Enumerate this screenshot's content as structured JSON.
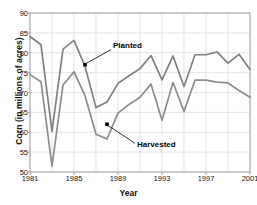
{
  "chart_data": {
    "type": "line",
    "title": "",
    "xlabel": "Year",
    "ylabel": "Corn (in millions of acres)",
    "xlim": [
      1981,
      2001
    ],
    "ylim": [
      50,
      90
    ],
    "yticks": [
      50,
      55,
      60,
      65,
      70,
      75,
      80,
      85,
      90
    ],
    "xticks": [
      1981,
      1985,
      1989,
      1993,
      1997,
      2001
    ],
    "xtick_labels": [
      "1981",
      "1985",
      "1989",
      "1993",
      "1997",
      "2001"
    ],
    "ytick_labels": [
      "50",
      "55",
      "60",
      "65",
      "70",
      "75",
      "80",
      "85",
      "90"
    ],
    "grid": true,
    "grid_x_step": 2,
    "legend": "none",
    "x": [
      1981,
      1982,
      1983,
      1984,
      1985,
      1986,
      1987,
      1988,
      1989,
      1990,
      1991,
      1992,
      1993,
      1994,
      1995,
      1996,
      1997,
      1998,
      1999,
      2000,
      2001
    ],
    "series": [
      {
        "name": "Planted",
        "color": "#808080",
        "values": [
          84.1,
          82.0,
          60.2,
          80.9,
          83.1,
          76.6,
          66.2,
          67.6,
          72.3,
          74.2,
          76.0,
          79.3,
          73.2,
          79.2,
          71.5,
          79.5,
          79.5,
          80.2,
          77.4,
          79.6,
          75.8
        ]
      },
      {
        "name": "Harvested",
        "color": "#8c8c8c",
        "values": [
          74.5,
          72.7,
          51.5,
          71.9,
          75.2,
          69.2,
          59.5,
          58.3,
          64.8,
          67.0,
          68.8,
          72.1,
          63.0,
          72.5,
          65.2,
          73.1,
          73.1,
          72.6,
          72.4,
          70.5,
          68.8
        ]
      }
    ],
    "annotations": [
      {
        "label": "Planted",
        "point_year": 1986,
        "point_value": 77.0
      },
      {
        "label": "Harvested",
        "point_year": 1988,
        "point_value": 62.0
      }
    ]
  }
}
